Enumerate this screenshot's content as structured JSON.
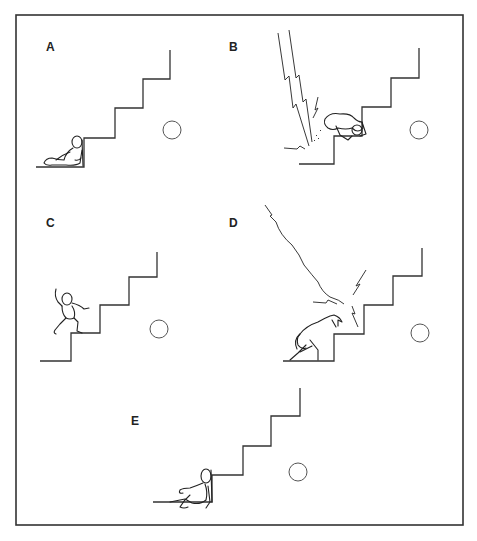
{
  "figure": {
    "frame": {
      "x": 16,
      "y": 15,
      "width": 447,
      "height": 510
    },
    "colors": {
      "line": "#333333",
      "background": "#ffffff"
    },
    "panels": [
      {
        "label": "A",
        "label_pos": [
          46,
          51
        ],
        "scene": "figure sitting slumped at foot of stairs",
        "stairs_origin": [
          36,
          167
        ],
        "ball": [
          172,
          130
        ]
      },
      {
        "label": "B",
        "label_pos": [
          229,
          51
        ],
        "scene": "lightning strikes near figure crawling on step",
        "stairs_origin": [
          299,
          164
        ],
        "ball": [
          419,
          130
        ]
      },
      {
        "label": "C",
        "label_pos": [
          46,
          227
        ],
        "scene": "figure stepping up the stairs",
        "stairs_origin": [
          40,
          361
        ],
        "ball": [
          159,
          329
        ]
      },
      {
        "label": "D",
        "label_pos": [
          229,
          227
        ],
        "scene": "lightning bolt strikes stairs, figure bending over",
        "stairs_origin": [
          283,
          361
        ],
        "ball": [
          420,
          333
        ]
      },
      {
        "label": "E",
        "label_pos": [
          131,
          425
        ],
        "scene": "figure sitting slumped at foot of stairs",
        "stairs_origin": [
          153,
          502
        ],
        "ball": [
          298,
          472
        ]
      }
    ]
  }
}
